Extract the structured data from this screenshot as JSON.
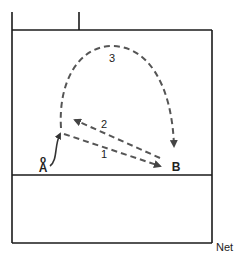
{
  "diagram": {
    "type": "court-drill",
    "players": [
      {
        "id": "A",
        "label": "A",
        "marker": "o"
      },
      {
        "id": "B",
        "label": "B"
      }
    ],
    "paths": [
      {
        "number": "1",
        "from": "A",
        "to": "B",
        "style": "dashed"
      },
      {
        "number": "2",
        "from": "B",
        "to": "A",
        "style": "dashed"
      },
      {
        "number": "3",
        "from": "A",
        "to": "B",
        "style": "dashed-arc"
      }
    ],
    "net_label": "Net",
    "colors": {
      "line": "#1a1a1a",
      "dash": "#555555",
      "background": "#ffffff"
    }
  }
}
